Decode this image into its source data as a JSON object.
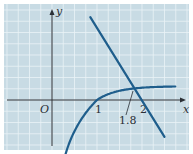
{
  "chart_data": {
    "type": "line",
    "title": "",
    "xlabel": "x",
    "ylabel": "y",
    "origin_label": "O",
    "x_ticks": [
      {
        "value": 1,
        "label": "1"
      },
      {
        "value": 2,
        "label": "2"
      }
    ],
    "xlim": [
      -1.05,
      3.05
    ],
    "ylim": [
      -1.1,
      2.1
    ],
    "grid": true,
    "grid_step": 0.25,
    "annotation": {
      "label": "1.8",
      "x": 1.8,
      "note": "x-coordinate of intersection of the two curves"
    },
    "series": [
      {
        "name": "increasing concave curve (y = ln x)",
        "points": [
          [
            0.18,
            -0.82
          ],
          [
            0.4,
            -0.5
          ],
          [
            0.7,
            -0.2
          ],
          [
            1.0,
            0.0
          ],
          [
            1.4,
            0.18
          ],
          [
            1.8,
            0.24
          ],
          [
            2.2,
            0.28
          ],
          [
            2.75,
            0.3
          ]
        ]
      },
      {
        "name": "decreasing line",
        "points": [
          [
            0.85,
            1.84
          ],
          [
            2.5,
            -0.82
          ]
        ]
      }
    ]
  },
  "colors": {
    "background_panel": "#c8dbe4",
    "grid": "#eaf2f6",
    "axes": "#2a2f35",
    "curve": "#1f5e8c",
    "frame": "#ffffff"
  }
}
